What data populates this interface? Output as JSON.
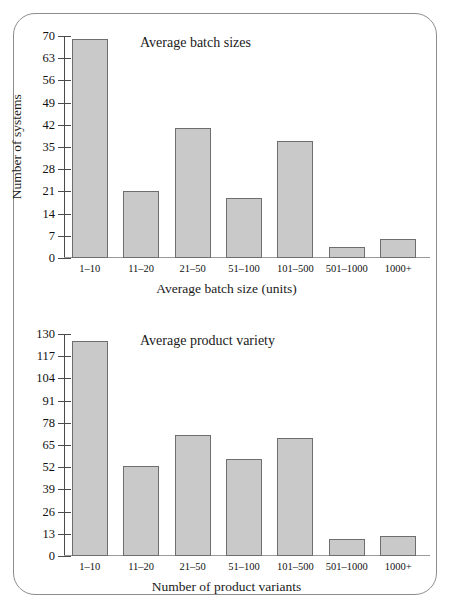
{
  "figure": {
    "frame_style": "rounded-rectangle-border",
    "border_color": "#8d8d8d",
    "background": "#ffffff"
  },
  "chart_data": [
    {
      "id": "average-batch-sizes",
      "type": "bar",
      "title": "Average batch sizes",
      "xlabel": "Average batch size (units)",
      "ylabel": "Number of systems",
      "categories": [
        "1–10",
        "11–20",
        "21–50",
        "51–100",
        "101–500",
        "501–1000",
        "1000+"
      ],
      "values": [
        69,
        21,
        41,
        19,
        37,
        3.5,
        6
      ],
      "ylim": [
        0,
        70
      ],
      "yticks": [
        0,
        7,
        14,
        21,
        28,
        35,
        42,
        49,
        56,
        63,
        70
      ],
      "ytick_labels": [
        "0",
        "7",
        "14",
        "21",
        "28",
        "35",
        "42",
        "49",
        "56",
        "63",
        "70"
      ],
      "grid": false,
      "legend": "none",
      "bar_fill": "#c9c9c9",
      "bar_edge": "#6e6e6e"
    },
    {
      "id": "average-product-variety",
      "type": "bar",
      "title": "Average product variety",
      "xlabel": "Number of product variants",
      "ylabel": "",
      "categories": [
        "1–10",
        "11–20",
        "21–50",
        "51–100",
        "101–500",
        "501–1000",
        "1000+"
      ],
      "values": [
        126,
        53,
        71,
        57,
        69,
        10,
        12
      ],
      "ylim": [
        0,
        130
      ],
      "yticks": [
        0,
        13,
        26,
        39,
        52,
        65,
        78,
        91,
        104,
        117,
        130
      ],
      "ytick_labels": [
        "0",
        "13",
        "26",
        "39",
        "52",
        "65",
        "78",
        "91",
        "104",
        "117",
        "130"
      ],
      "grid": false,
      "legend": "none",
      "bar_fill": "#c9c9c9",
      "bar_edge": "#6e6e6e"
    }
  ]
}
